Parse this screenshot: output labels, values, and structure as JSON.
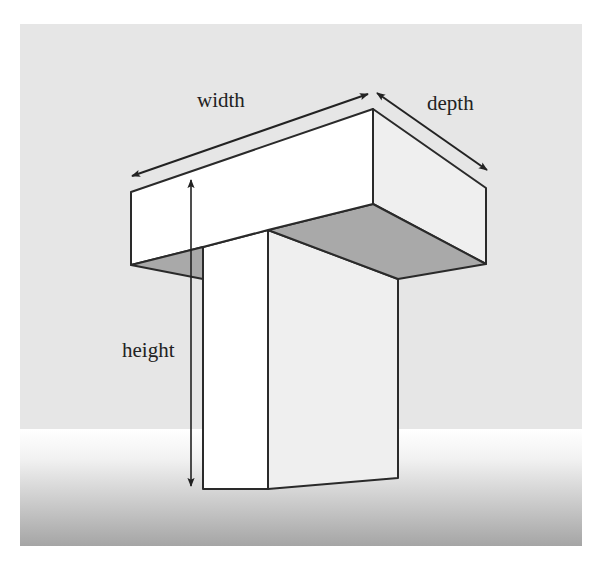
{
  "figure": {
    "type": "3D T-shaped block with dimension arrows",
    "labels": {
      "width": "width",
      "depth": "depth",
      "height": "height"
    },
    "colors": {
      "background": "#e6e6e6",
      "floor_top": "#ffffff",
      "floor_bottom": "#a5a5a5",
      "front_face": "#ffffff",
      "side_face": "#efefef",
      "underside": "#a9a9a9",
      "edge": "#2a2a2a"
    }
  }
}
